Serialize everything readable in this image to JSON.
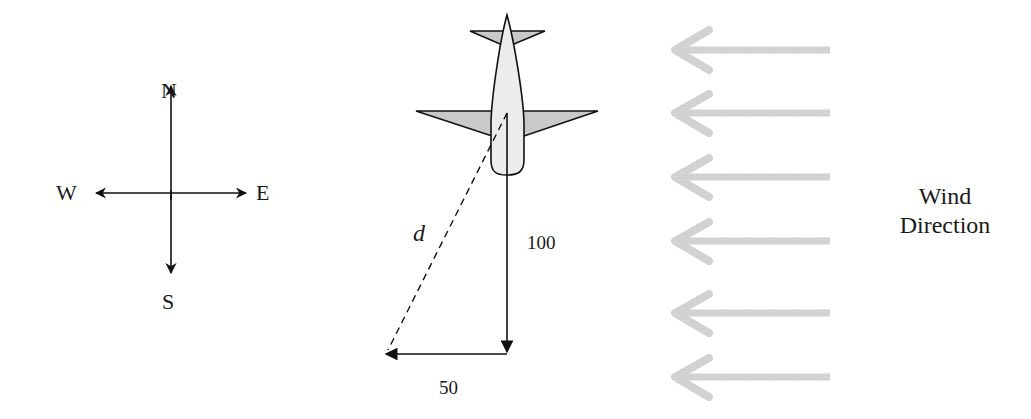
{
  "compass": {
    "north": "N",
    "south": "S",
    "east": "E",
    "west": "W"
  },
  "vectors": {
    "resultant_label": "d",
    "south_magnitude": "100",
    "west_magnitude": "50"
  },
  "wind": {
    "label_line1": "Wind",
    "label_line2": "Direction",
    "arrow_count": 6,
    "arrow_color": "#c8c8c8"
  },
  "colors": {
    "stroke": "#111111",
    "plane_body": "#ececec",
    "plane_wings": "#c9c9c9"
  }
}
